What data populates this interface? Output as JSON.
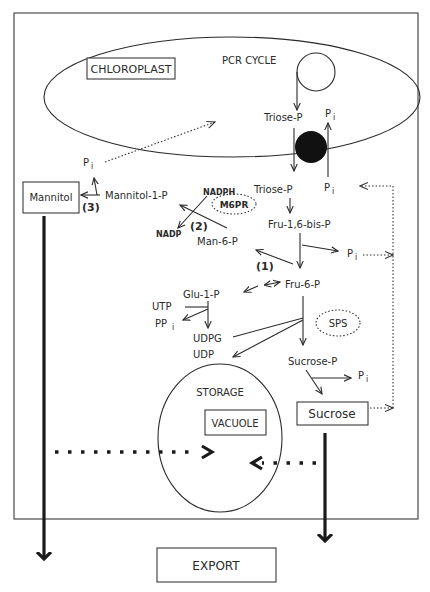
{
  "diagram": {
    "compartments": {
      "chloroplast": "CHLOROPLAST",
      "pcr_cycle": "PCR CYCLE",
      "storage": "STORAGE",
      "vacuole": "VACUOLE",
      "export": "EXPORT"
    },
    "products": {
      "mannitol": "Mannitol",
      "sucrose": "Sucrose"
    },
    "metabolites": {
      "triose_p_chloroplast": "Triose-P",
      "triose_p_cytosol": "Triose-P",
      "pi_chloroplast": "P",
      "pi_transport": "P",
      "pi_mannitol": "P",
      "pi_fbp": "P",
      "pi_sucrose": "P",
      "pi_subscript": "i",
      "fru_1_6_bis_p": "Fru-1,6-bis-P",
      "fru_6_p": "Fru-6-P",
      "man_6_p": "Man-6-P",
      "mannitol_1_p": "Mannitol-1-P",
      "glu_1_p": "Glu-1-P",
      "utp": "UTP",
      "pp": "PP",
      "udpg": "UDPG",
      "udp": "UDP",
      "sucrose_p": "Sucrose-P",
      "nadph": "NADPH",
      "nadp": "NADP"
    },
    "enzymes": {
      "m6pr": "M6PR",
      "sps": "SPS"
    },
    "reaction_labels": {
      "step_1": "(1)",
      "step_2": "(2)",
      "step_3": "(3)"
    },
    "colors": {
      "line": "#2a2a2a",
      "background": "#ffffff",
      "translocator": "#111111"
    }
  }
}
